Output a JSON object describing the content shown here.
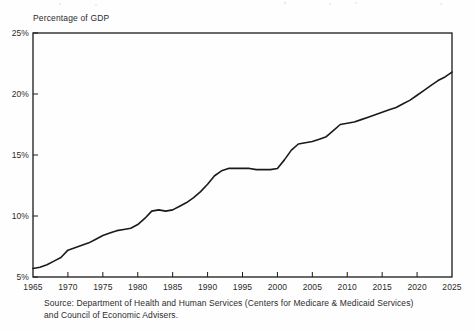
{
  "axis_title": "Percentage of GDP",
  "source": {
    "line1": "Source: Department of Health and Human Services (Centers for Medicare & Medicaid Services)",
    "line2": "and Council of Economic Advisers."
  },
  "chart_data": {
    "type": "line",
    "title": "",
    "subtitle": "",
    "xlabel": "",
    "ylabel": "Percentage of GDP",
    "xlim": [
      1965,
      2025
    ],
    "ylim": [
      5,
      25
    ],
    "xticks": [
      1965,
      1970,
      1975,
      1980,
      1985,
      1990,
      1995,
      2000,
      2005,
      2010,
      2015,
      2020,
      2025
    ],
    "xtick_labels": [
      "1965",
      "1970",
      "1975",
      "1980",
      "1985",
      "1990",
      "1995",
      "2000",
      "2005",
      "2010",
      "2015",
      "2020",
      "2025"
    ],
    "yticks": [
      5,
      10,
      15,
      20,
      25
    ],
    "ytick_labels": [
      "5%",
      "10%",
      "15%",
      "20%",
      "25%"
    ],
    "grid": false,
    "legend": false,
    "legend_position": "none",
    "line_color": "#1a1a1a",
    "line_width": 1.6,
    "series": [
      {
        "name": "National health expenditures",
        "x": [
          1965,
          1966,
          1967,
          1968,
          1969,
          1970,
          1971,
          1972,
          1973,
          1974,
          1975,
          1976,
          1977,
          1978,
          1979,
          1980,
          1981,
          1982,
          1983,
          1984,
          1985,
          1986,
          1987,
          1988,
          1989,
          1990,
          1991,
          1992,
          1993,
          1994,
          1995,
          1996,
          1997,
          1998,
          1999,
          2000,
          2001,
          2002,
          2003,
          2004,
          2005,
          2006,
          2007,
          2008,
          2009,
          2010,
          2011,
          2012,
          2013,
          2014,
          2015,
          2016,
          2017,
          2018,
          2019,
          2020,
          2021,
          2022,
          2023,
          2024,
          2025
        ],
        "values": [
          5.7,
          5.8,
          6.0,
          6.3,
          6.6,
          7.2,
          7.4,
          7.6,
          7.8,
          8.1,
          8.4,
          8.6,
          8.8,
          8.9,
          9.0,
          9.3,
          9.8,
          10.4,
          10.5,
          10.4,
          10.5,
          10.8,
          11.1,
          11.5,
          12.0,
          12.6,
          13.3,
          13.7,
          13.9,
          13.9,
          13.9,
          13.9,
          13.8,
          13.8,
          13.8,
          13.9,
          14.6,
          15.4,
          15.9,
          16.0,
          16.1,
          16.3,
          16.5,
          17.0,
          17.5,
          17.6,
          17.7,
          17.9,
          18.1,
          18.3,
          18.5,
          18.7,
          18.9,
          19.2,
          19.5,
          19.9,
          20.3,
          20.7,
          21.1,
          21.4,
          21.8
        ]
      }
    ]
  }
}
